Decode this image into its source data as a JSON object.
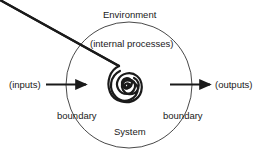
{
  "diagram": {
    "labels": {
      "environment": "Environment",
      "internal_processes": "(internal processes)",
      "inputs": "(inputs)",
      "outputs": "(outputs)",
      "boundary_left": "boundary",
      "boundary_right": "boundary",
      "system": "System"
    },
    "colors": {
      "line": "#1a1a1a",
      "background": "#ffffff"
    }
  }
}
